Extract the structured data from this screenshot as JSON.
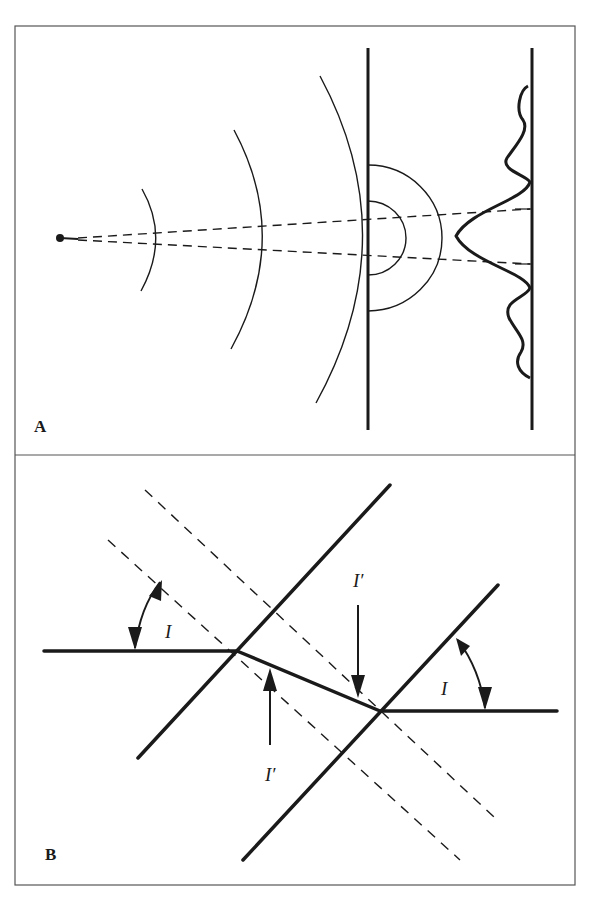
{
  "figure": {
    "panels": [
      {
        "id": "A",
        "label": "A",
        "description": "Point source emitting wavefronts through a slit, producing a diffraction intensity pattern on a screen"
      },
      {
        "id": "B",
        "label": "B",
        "description": "Ray refracted through a slab between two parallel boundaries with incidence angle I and refraction angle I'"
      }
    ],
    "panelB_labels": {
      "incident_angle_left": "I",
      "incident_angle_right": "I",
      "refracted_angle_top": "I′",
      "refracted_angle_bottom": "I′"
    },
    "colors": {
      "ink": "#1a1a1a",
      "frame": "#555555",
      "background": "#ffffff"
    }
  }
}
